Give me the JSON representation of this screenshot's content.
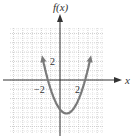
{
  "chart_data": {
    "type": "line",
    "title": "",
    "xlabel": "x",
    "ylabel": "f(x)",
    "xlim": [
      -5,
      5
    ],
    "ylim": [
      -5.5,
      5.5
    ],
    "grid": true,
    "x_tick_labels": [
      {
        "value": -2,
        "label": "−2"
      },
      {
        "value": 2,
        "label": "2"
      }
    ],
    "y_tick_labels": [
      {
        "value": 2,
        "label": "2"
      }
    ],
    "series": [
      {
        "name": "f(x)",
        "description": "upward parabola with arrows at both ends",
        "vertex": [
          0.7,
          -3.6
        ],
        "roots": [
          -1.3,
          2.7
        ],
        "x": [
          -1.9,
          -1.5,
          -1.0,
          -0.5,
          0.0,
          0.5,
          0.7,
          1.0,
          1.5,
          2.0,
          2.5,
          3.0,
          3.3
        ],
        "values": [
          3.7,
          1.2,
          -0.7,
          -2.2,
          -3.1,
          -3.56,
          -3.6,
          -3.5,
          -2.96,
          -2.1,
          -0.76,
          1.7,
          3.7
        ]
      }
    ],
    "colors": {
      "curve": "#777777",
      "axis": "#333333",
      "grid": "#c8c8c8"
    }
  }
}
